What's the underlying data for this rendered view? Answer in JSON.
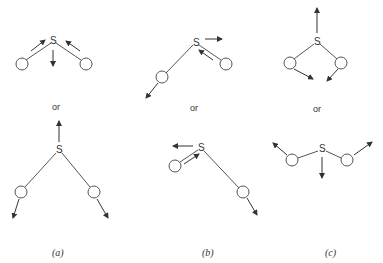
{
  "figure": {
    "central_atom_label": "S",
    "separator_label": "or",
    "panels": [
      {
        "id": "a",
        "caption": "(a)",
        "mode": "symmetric stretch"
      },
      {
        "id": "b",
        "caption": "(b)",
        "mode": "asymmetric stretch"
      },
      {
        "id": "c",
        "caption": "(c)",
        "mode": "bending"
      }
    ]
  },
  "colors": {
    "line": "#555555",
    "arrow": "#333333",
    "background": "#ffffff"
  }
}
